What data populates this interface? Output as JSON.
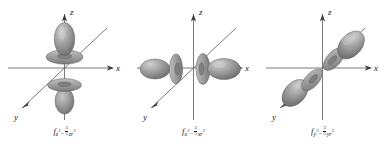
{
  "figure": {
    "name": "f-orbital-shapes",
    "background": "#ffffff",
    "panel_count": 3,
    "colors": {
      "axis": "#6b6b6b",
      "lobe_light": "#c9c9c9",
      "lobe_mid": "#9a9a9a",
      "lobe_dark": "#6f6f6f",
      "outline": "#5a5a5a",
      "text": "#1a1a1a"
    }
  },
  "axes": {
    "z_label": "z",
    "x_label": "x",
    "y_label": "y"
  },
  "panels": [
    {
      "id": "panel-fz3",
      "orbital": "fz3",
      "caption": {
        "symbol": "f",
        "sub_main": "z",
        "sub_main_exp": "3",
        "minus": "−",
        "frac_num": "3",
        "frac_den": "5",
        "sub_tail": "zr",
        "sub_tail_exp": "2"
      },
      "lobe_axis": "z",
      "description": "two large lobes along z with two toroidal collars"
    },
    {
      "id": "panel-fx3",
      "orbital": "fx3",
      "caption": {
        "symbol": "f",
        "sub_main": "x",
        "sub_main_exp": "3",
        "minus": "−",
        "frac_num": "3",
        "frac_den": "5",
        "sub_tail": "xr",
        "sub_tail_exp": "2"
      },
      "lobe_axis": "x",
      "description": "two large lobes along x with two collars"
    },
    {
      "id": "panel-fy3",
      "orbital": "fy3",
      "caption": {
        "symbol": "f",
        "sub_main": "y",
        "sub_main_exp": "3",
        "minus": "−",
        "frac_num": "3",
        "frac_den": "5",
        "sub_tail": "yr",
        "sub_tail_exp": "2"
      },
      "lobe_axis": "y",
      "description": "two large lobes along y (diagonal) with two collars"
    }
  ]
}
